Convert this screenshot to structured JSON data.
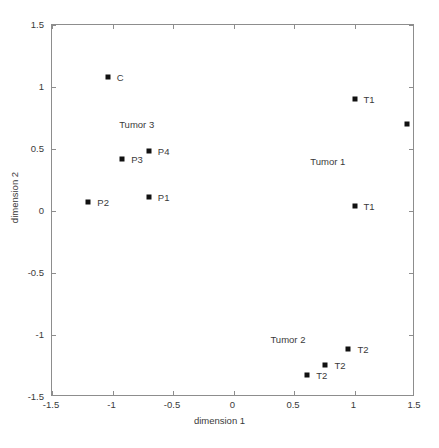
{
  "chart_data": {
    "type": "scatter",
    "title": "",
    "xlabel": "dimension 1",
    "ylabel": "dimension 2",
    "xlim": [
      -1.5,
      1.5
    ],
    "ylim": [
      -1.5,
      1.5
    ],
    "xticks": [
      "-1.5",
      "-1",
      "-0.5",
      "0",
      "0.5",
      "1",
      "1.5"
    ],
    "xtick_values": [
      -1.5,
      -1,
      -0.5,
      0,
      0.5,
      1,
      1.5
    ],
    "yticks": [
      "-1.5",
      "-1",
      "-0.5",
      "0",
      "0.5",
      "1",
      "1.5"
    ],
    "ytick_values": [
      -1.5,
      -1,
      -0.5,
      0,
      0.5,
      1,
      1.5
    ],
    "grid": false,
    "legend": "none",
    "marker": "filled-square",
    "marker_color": "#111111",
    "points": [
      {
        "label": "C",
        "x": -1.04,
        "y": 1.08,
        "label_pos": "right"
      },
      {
        "label": "P4",
        "x": -0.7,
        "y": 0.48,
        "label_pos": "right"
      },
      {
        "label": "P3",
        "x": -0.92,
        "y": 0.42,
        "label_pos": "right"
      },
      {
        "label": "P1",
        "x": -0.7,
        "y": 0.11,
        "label_pos": "right"
      },
      {
        "label": "P2",
        "x": -1.2,
        "y": 0.07,
        "label_pos": "right"
      },
      {
        "label": "T1",
        "x": 1.0,
        "y": 0.9,
        "label_pos": "right"
      },
      {
        "label": "T1",
        "x": 1.43,
        "y": 0.7,
        "label_pos": "right"
      },
      {
        "label": "T1",
        "x": 1.0,
        "y": 0.04,
        "label_pos": "right"
      },
      {
        "label": "T2",
        "x": 0.95,
        "y": -1.11,
        "label_pos": "right"
      },
      {
        "label": "T2",
        "x": 0.76,
        "y": -1.24,
        "label_pos": "right"
      },
      {
        "label": "T2",
        "x": 0.61,
        "y": -1.32,
        "label_pos": "right"
      }
    ],
    "annotations": [
      {
        "text": "Tumor 3",
        "x": -0.8,
        "y": 0.7
      },
      {
        "text": "Tumor 1",
        "x": 0.78,
        "y": 0.4
      },
      {
        "text": "Tumor 2",
        "x": 0.45,
        "y": -1.03
      }
    ]
  }
}
